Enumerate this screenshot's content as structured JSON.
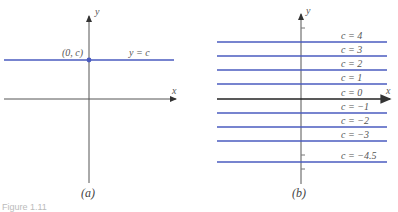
{
  "panel_a": {
    "caption": "(a)",
    "x_axis_label": "x",
    "y_axis_label": "y",
    "point_label": "(0, c)",
    "line_label": "y = c",
    "line_color": "#4a5bbf",
    "axis_color": "#555555"
  },
  "panel_b": {
    "caption": "(b)",
    "x_axis_label": "x",
    "y_axis_label": "y",
    "line_color": "#4a5bbf",
    "axis_color": "#222222",
    "lines": [
      {
        "c": 4,
        "label": "c = 4"
      },
      {
        "c": 3,
        "label": "c = 3"
      },
      {
        "c": 2,
        "label": "c = 2"
      },
      {
        "c": 1,
        "label": "c = 1"
      },
      {
        "c": 0,
        "label": "c = 0"
      },
      {
        "c": -1,
        "label": "c = −1"
      },
      {
        "c": -2,
        "label": "c = −2"
      },
      {
        "c": -3,
        "label": "c = −3"
      },
      {
        "c": -4.5,
        "label": "c = −4.5"
      }
    ]
  },
  "figure_caption_fragment": "Figure 1.11"
}
